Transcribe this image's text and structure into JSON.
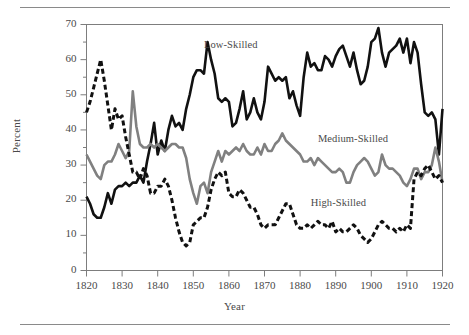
{
  "figure": {
    "has_top_rule": true,
    "has_bottom_rule": true,
    "rule_color": "#8a8a8a"
  },
  "chart_data": {
    "type": "line",
    "title": "",
    "subtitle": "",
    "xlabel": "Year",
    "ylabel": "Percent",
    "xlim": [
      1820,
      1920
    ],
    "ylim": [
      0,
      70
    ],
    "xticks": [
      1820,
      1830,
      1840,
      1850,
      1860,
      1870,
      1880,
      1890,
      1900,
      1910,
      1920
    ],
    "yticks": [
      0,
      10,
      20,
      30,
      40,
      50,
      60,
      70
    ],
    "yminorticks": [
      5,
      15,
      25,
      35,
      45,
      55,
      65
    ],
    "grid": false,
    "legend_position": "inline-annotations",
    "annotations": [
      {
        "text": "Low-Skilled",
        "x": 1853,
        "y": 64,
        "series": "Low-Skilled"
      },
      {
        "text": "Medium-Skilled",
        "x": 1885,
        "y": 37,
        "series": "Medium-Skilled"
      },
      {
        "text": "High-Skilled",
        "x": 1883,
        "y": 19,
        "series": "High-Skilled"
      }
    ],
    "series": [
      {
        "name": "Low-Skilled",
        "color": "#111111",
        "style": "solid",
        "width": 2.6,
        "x": [
          1820,
          1821,
          1822,
          1823,
          1824,
          1825,
          1826,
          1827,
          1828,
          1829,
          1830,
          1831,
          1832,
          1833,
          1834,
          1835,
          1836,
          1837,
          1838,
          1839,
          1840,
          1841,
          1842,
          1843,
          1844,
          1845,
          1846,
          1847,
          1848,
          1849,
          1850,
          1851,
          1852,
          1853,
          1854,
          1855,
          1856,
          1857,
          1858,
          1859,
          1860,
          1861,
          1862,
          1863,
          1864,
          1865,
          1866,
          1867,
          1868,
          1869,
          1870,
          1871,
          1872,
          1873,
          1874,
          1875,
          1876,
          1877,
          1878,
          1879,
          1880,
          1881,
          1882,
          1883,
          1884,
          1885,
          1886,
          1887,
          1888,
          1889,
          1890,
          1891,
          1892,
          1893,
          1894,
          1895,
          1896,
          1897,
          1898,
          1899,
          1900,
          1901,
          1902,
          1903,
          1904,
          1905,
          1906,
          1907,
          1908,
          1909,
          1910,
          1911,
          1912,
          1913,
          1914,
          1915,
          1916,
          1917,
          1918,
          1919,
          1920
        ],
        "y": [
          21,
          19,
          16,
          15,
          15,
          18,
          22,
          19,
          23,
          24,
          24,
          25,
          24,
          25,
          25,
          27,
          25,
          31,
          36,
          42,
          33,
          37,
          34,
          40,
          44,
          41,
          42,
          40,
          46,
          50,
          55,
          57,
          57,
          56,
          65,
          60,
          56,
          49,
          48,
          49,
          48,
          41,
          42,
          46,
          51,
          43,
          45,
          49,
          45,
          43,
          48,
          58,
          56,
          54,
          55,
          54,
          55,
          49,
          51,
          47,
          44,
          55,
          62,
          58,
          59,
          57,
          57,
          61,
          60,
          58,
          61,
          63,
          64,
          61,
          58,
          62,
          57,
          53,
          54,
          58,
          65,
          66,
          69,
          62,
          58,
          62,
          63,
          64,
          66,
          62,
          66,
          59,
          65,
          62,
          53,
          45,
          44,
          45,
          43,
          33,
          46
        ]
      },
      {
        "name": "Medium-Skilled",
        "color": "#808080",
        "style": "solid",
        "width": 2.6,
        "x": [
          1820,
          1821,
          1822,
          1823,
          1824,
          1825,
          1826,
          1827,
          1828,
          1829,
          1830,
          1831,
          1832,
          1833,
          1834,
          1835,
          1836,
          1837,
          1838,
          1839,
          1840,
          1841,
          1842,
          1843,
          1844,
          1845,
          1846,
          1847,
          1848,
          1849,
          1850,
          1851,
          1852,
          1853,
          1854,
          1855,
          1856,
          1857,
          1858,
          1859,
          1860,
          1861,
          1862,
          1863,
          1864,
          1865,
          1866,
          1867,
          1868,
          1869,
          1870,
          1871,
          1872,
          1873,
          1874,
          1875,
          1876,
          1877,
          1878,
          1879,
          1880,
          1881,
          1882,
          1883,
          1884,
          1885,
          1886,
          1887,
          1888,
          1889,
          1890,
          1891,
          1892,
          1893,
          1894,
          1895,
          1896,
          1897,
          1898,
          1899,
          1900,
          1901,
          1902,
          1903,
          1904,
          1905,
          1906,
          1907,
          1908,
          1909,
          1910,
          1911,
          1912,
          1913,
          1914,
          1915,
          1916,
          1917,
          1918,
          1919,
          1920
        ],
        "y": [
          33,
          31,
          29,
          27,
          26,
          30,
          31,
          31,
          33,
          36,
          34,
          32,
          34,
          51,
          41,
          36,
          35,
          35,
          36,
          35,
          36,
          35,
          34,
          35,
          36,
          36,
          35,
          35,
          32,
          26,
          22,
          19,
          24,
          25,
          22,
          28,
          31,
          34,
          31,
          34,
          33,
          34,
          35,
          34,
          36,
          34,
          33,
          33,
          35,
          33,
          36,
          34,
          34,
          36,
          37,
          39,
          37,
          36,
          35,
          34,
          33,
          31,
          31,
          32,
          30,
          32,
          31,
          30,
          29,
          28,
          28,
          29,
          28,
          25,
          25,
          28,
          30,
          31,
          32,
          31,
          29,
          27,
          28,
          33,
          30,
          29,
          29,
          28,
          27,
          25,
          24,
          26,
          29,
          29,
          26,
          28,
          28,
          30,
          35,
          31,
          25
        ]
      },
      {
        "name": "High-Skilled",
        "color": "#111111",
        "style": "dashed",
        "width": 3.0,
        "dasharray": "5,3",
        "x": [
          1820,
          1821,
          1822,
          1823,
          1824,
          1825,
          1826,
          1827,
          1828,
          1829,
          1830,
          1831,
          1832,
          1833,
          1834,
          1835,
          1836,
          1837,
          1838,
          1839,
          1840,
          1841,
          1842,
          1843,
          1844,
          1845,
          1846,
          1847,
          1848,
          1849,
          1850,
          1851,
          1852,
          1853,
          1854,
          1855,
          1856,
          1857,
          1858,
          1859,
          1860,
          1861,
          1862,
          1863,
          1864,
          1865,
          1866,
          1867,
          1868,
          1869,
          1870,
          1871,
          1872,
          1873,
          1874,
          1875,
          1876,
          1877,
          1878,
          1879,
          1880,
          1881,
          1882,
          1883,
          1884,
          1885,
          1886,
          1887,
          1888,
          1889,
          1890,
          1891,
          1892,
          1893,
          1894,
          1895,
          1896,
          1897,
          1898,
          1899,
          1900,
          1901,
          1902,
          1903,
          1904,
          1905,
          1906,
          1907,
          1908,
          1909,
          1910,
          1911,
          1912,
          1913,
          1914,
          1915,
          1916,
          1917,
          1918,
          1919,
          1920
        ],
        "y": [
          45,
          48,
          52,
          56,
          60,
          54,
          47,
          40,
          46,
          43,
          44,
          38,
          33,
          28,
          28,
          26,
          29,
          27,
          22,
          22,
          24,
          24,
          26,
          24,
          20,
          15,
          11,
          8,
          7,
          8,
          13,
          14,
          15,
          15,
          18,
          23,
          26,
          28,
          27,
          28,
          22,
          21,
          21,
          23,
          22,
          20,
          18,
          18,
          16,
          13,
          12,
          13,
          13,
          13,
          15,
          17,
          19,
          19,
          16,
          13,
          12,
          12,
          13,
          12,
          13,
          14,
          13,
          13,
          12,
          14,
          11,
          12,
          11,
          11,
          12,
          13,
          12,
          10,
          9,
          8,
          9,
          11,
          13,
          14,
          13,
          12,
          12,
          11,
          12,
          11,
          13,
          12,
          26,
          28,
          27,
          29,
          30,
          28,
          26,
          27,
          25
        ]
      }
    ]
  }
}
